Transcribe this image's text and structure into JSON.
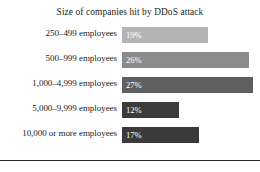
{
  "chart_data": {
    "type": "bar",
    "orientation": "horizontal",
    "title": "Size of companies hit by DDoS attack",
    "xlabel": "",
    "ylabel": "",
    "categories": [
      "250–499 employees",
      "500–999 employees",
      "1,000–4,999 employees",
      "5,000–9,999 employees",
      "10,000 or more employees"
    ],
    "values": [
      19,
      26,
      27,
      12,
      17
    ],
    "value_labels": [
      "19%",
      "26%",
      "27%",
      "12%",
      "17%"
    ],
    "xlim": [
      0,
      27
    ],
    "grid": false,
    "legend": null,
    "bar_colors": [
      "#b4b4b4",
      "#8b8b8b",
      "#5f5f5f",
      "#3b3b3b",
      "#3a3a3a"
    ],
    "bar_lengths_px": [
      86,
      127,
      131,
      57,
      77
    ],
    "label_color": "#ffffff"
  },
  "figure": {
    "background": "#ffffff",
    "title_color": "#1c1c1c",
    "category_label_color": "#1c1c1c",
    "rule_color": "#2a2a2a"
  }
}
